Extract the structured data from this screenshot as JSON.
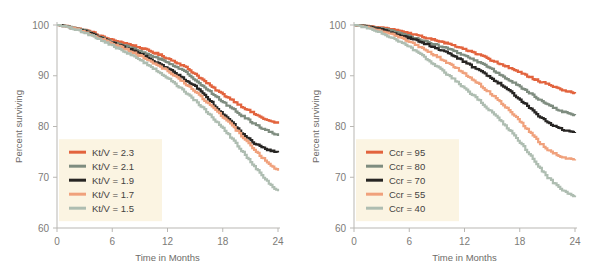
{
  "figure": {
    "background": "#ffffff",
    "panel_count": 2
  },
  "palette": {
    "series_1": "#E2633D",
    "series_2": "#7E8C7F",
    "series_3": "#272523",
    "series_4": "#F0A17C",
    "series_5": "#AEBDB1",
    "axis": "#b9b7b3",
    "tick_text": "#7d7b78",
    "axis_title": "#6e6c69",
    "legend_bg": "#fbf4e2"
  },
  "chart_data": [
    {
      "id": "left-panel",
      "type": "line",
      "title": "",
      "xlabel": "Time in Months",
      "ylabel": "Percent surviving",
      "xlim": [
        0,
        24
      ],
      "ylim": [
        60,
        100
      ],
      "xticks": [
        0,
        6,
        12,
        18,
        24
      ],
      "xtick_labels": [
        "0",
        "6",
        "12",
        "18",
        "24"
      ],
      "yticks": [
        60,
        70,
        80,
        90,
        100
      ],
      "ytick_labels": [
        "60",
        "70",
        "80",
        "90",
        "100"
      ],
      "grid": false,
      "legend_position": "lower-left",
      "x": [
        0,
        1,
        2,
        3,
        4,
        5,
        6,
        7,
        8,
        9,
        10,
        11,
        12,
        13,
        14,
        15,
        16,
        17,
        18,
        19,
        20,
        21,
        22,
        23,
        24
      ],
      "series": [
        {
          "name": "Kt/V = 2.3",
          "color": "#E2633D",
          "values": [
            100,
            99.8,
            99.4,
            99.0,
            98.4,
            97.6,
            97.0,
            96.6,
            96.1,
            95.5,
            94.9,
            94.2,
            93.4,
            92.6,
            91.6,
            90.3,
            88.9,
            87.5,
            86.3,
            85.2,
            84.0,
            82.9,
            81.9,
            81.1,
            80.6
          ]
        },
        {
          "name": "Kt/V = 2.1",
          "color": "#7E8C7F",
          "values": [
            100,
            99.8,
            99.3,
            98.9,
            98.2,
            97.4,
            96.6,
            96.1,
            95.5,
            94.8,
            94.1,
            93.4,
            92.6,
            91.7,
            90.6,
            89.2,
            87.7,
            86.2,
            84.8,
            83.5,
            82.2,
            81.0,
            79.9,
            79.0,
            78.2
          ]
        },
        {
          "name": "Kt/V = 1.9",
          "color": "#272523",
          "values": [
            100,
            99.7,
            99.2,
            98.7,
            98.0,
            97.2,
            96.4,
            95.8,
            95.1,
            94.3,
            93.4,
            92.4,
            91.4,
            90.3,
            89.1,
            87.9,
            86.3,
            84.3,
            82.4,
            80.7,
            78.8,
            77.2,
            76.1,
            75.3,
            74.9
          ]
        },
        {
          "name": "Kt/V = 1.7",
          "color": "#F0A17C",
          "values": [
            100,
            99.7,
            99.2,
            98.6,
            97.9,
            97.1,
            96.3,
            95.6,
            94.8,
            93.9,
            93.0,
            92.0,
            90.9,
            89.7,
            88.3,
            86.8,
            85.2,
            83.6,
            81.9,
            80.1,
            78.2,
            76.2,
            74.3,
            72.6,
            71.3
          ]
        },
        {
          "name": "Kt/V = 1.5",
          "color": "#AEBDB1",
          "values": [
            100,
            99.6,
            99.1,
            98.5,
            97.7,
            96.8,
            95.9,
            95.0,
            94.1,
            93.1,
            92.0,
            90.8,
            89.5,
            88.1,
            86.6,
            85.0,
            83.3,
            81.5,
            79.6,
            77.5,
            75.3,
            73.0,
            70.8,
            68.8,
            67.2
          ]
        }
      ]
    },
    {
      "id": "right-panel",
      "type": "line",
      "title": "",
      "xlabel": "Time in Months",
      "ylabel": "Percent surviving",
      "xlim": [
        0,
        24
      ],
      "ylim": [
        60,
        100
      ],
      "xticks": [
        0,
        6,
        12,
        18,
        24
      ],
      "xtick_labels": [
        "0",
        "6",
        "12",
        "18",
        "24"
      ],
      "yticks": [
        60,
        70,
        80,
        90,
        100
      ],
      "ytick_labels": [
        "60",
        "70",
        "80",
        "90",
        "100"
      ],
      "grid": false,
      "legend_position": "lower-left",
      "x": [
        0,
        1,
        2,
        3,
        4,
        5,
        6,
        7,
        8,
        9,
        10,
        11,
        12,
        13,
        14,
        15,
        16,
        17,
        18,
        19,
        20,
        21,
        22,
        23,
        24
      ],
      "series": [
        {
          "name": "Ccr = 95",
          "color": "#E2633D",
          "values": [
            100,
            99.9,
            99.7,
            99.5,
            99.2,
            98.8,
            98.3,
            97.9,
            97.4,
            96.9,
            96.4,
            95.8,
            95.2,
            94.5,
            93.8,
            93.0,
            92.2,
            91.4,
            90.6,
            89.8,
            89.0,
            88.3,
            87.6,
            87.0,
            86.5
          ]
        },
        {
          "name": "Ccr = 80",
          "color": "#7E8C7F",
          "values": [
            100,
            99.9,
            99.6,
            99.3,
            98.9,
            98.4,
            97.8,
            97.2,
            96.6,
            96.0,
            95.4,
            94.7,
            93.9,
            93.1,
            92.2,
            91.2,
            90.1,
            89.0,
            87.8,
            86.6,
            85.4,
            84.3,
            83.4,
            82.7,
            82.2
          ]
        },
        {
          "name": "Ccr = 70",
          "color": "#272523",
          "values": [
            100,
            99.8,
            99.5,
            99.1,
            98.6,
            98.0,
            97.4,
            96.8,
            96.1,
            95.4,
            94.6,
            93.7,
            92.7,
            91.6,
            90.5,
            89.4,
            88.2,
            86.8,
            85.3,
            83.7,
            82.1,
            80.8,
            79.8,
            79.2,
            78.9
          ]
        },
        {
          "name": "Ccr = 55",
          "color": "#F0A17C",
          "values": [
            100,
            99.7,
            99.3,
            98.8,
            98.2,
            97.5,
            96.7,
            95.8,
            94.8,
            93.8,
            92.7,
            91.6,
            90.4,
            89.1,
            87.7,
            86.2,
            84.6,
            82.9,
            81.0,
            79.0,
            77.0,
            75.4,
            74.4,
            73.8,
            73.5
          ]
        },
        {
          "name": "Ccr = 40",
          "color": "#AEBDB1",
          "values": [
            100,
            99.6,
            99.1,
            98.4,
            97.6,
            96.7,
            95.6,
            94.4,
            93.1,
            91.8,
            90.4,
            89.0,
            87.5,
            86.0,
            84.4,
            82.7,
            80.9,
            79.0,
            76.9,
            74.6,
            72.2,
            70.0,
            68.3,
            67.0,
            66.3
          ]
        }
      ]
    }
  ],
  "panels": [
    {
      "name": "left-panel",
      "ylabel": "Percent surviving",
      "xlabel": "Time in Months",
      "legend": {
        "items": [
          {
            "label": "Kt/V = 2.3",
            "color": "#E2633D"
          },
          {
            "label": "Kt/V = 2.1",
            "color": "#7E8C7F"
          },
          {
            "label": "Kt/V = 1.9",
            "color": "#272523"
          },
          {
            "label": "Kt/V = 1.7",
            "color": "#F0A17C"
          },
          {
            "label": "Kt/V = 1.5",
            "color": "#AEBDB1"
          }
        ]
      }
    },
    {
      "name": "right-panel",
      "ylabel": "Percent surviving",
      "xlabel": "Time in Months",
      "legend": {
        "items": [
          {
            "label": "Ccr = 95",
            "color": "#E2633D"
          },
          {
            "label": "Ccr = 80",
            "color": "#7E8C7F"
          },
          {
            "label": "Ccr = 70",
            "color": "#272523"
          },
          {
            "label": "Ccr = 55",
            "color": "#F0A17C"
          },
          {
            "label": "Ccr = 40",
            "color": "#AEBDB1"
          }
        ]
      }
    }
  ]
}
